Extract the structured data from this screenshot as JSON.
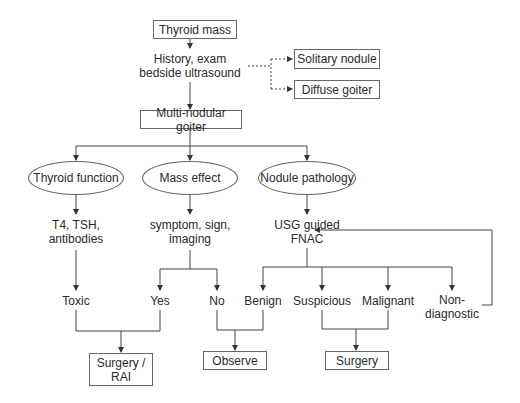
{
  "diagram": {
    "title": "Thyroid mass",
    "step1": "History, exam bedside ultrasound",
    "step1_lines": [
      "History, exam",
      "bedside ultrasound"
    ],
    "side_outcomes": [
      "Solitary nodule",
      "Diffuse goiter"
    ],
    "main_branch": "Multi-nodular goiter",
    "assessments": [
      {
        "label": "Thyroid function",
        "tests": [
          "T4, TSH,",
          "antibodies"
        ]
      },
      {
        "label": "Mass effect",
        "tests": [
          "symptom, sign,",
          "imaging"
        ]
      },
      {
        "label": "Nodule pathology",
        "tests": [
          "USG guided",
          "FNAC"
        ]
      }
    ],
    "results": {
      "toxic": "Toxic",
      "yes": "Yes",
      "no": "No",
      "benign": "Benign",
      "suspicious": "Suspicious",
      "malignant": "Malignant",
      "nondiagnostic_lines": [
        "Non-",
        "diagnostic"
      ]
    },
    "outcomes": {
      "surgery_rai_lines": [
        "Surgery /",
        "RAI"
      ],
      "observe": "Observe",
      "surgery": "Surgery"
    }
  }
}
